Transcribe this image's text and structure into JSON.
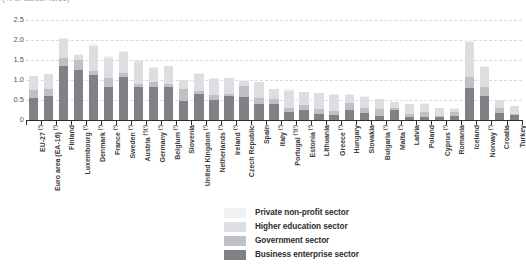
{
  "subtitle": "(% of labour force)",
  "colors": {
    "business_enterprise": "#808086",
    "government": "#bfbfc4",
    "higher_education": "#dedee2",
    "private_non_profit": "#f1f1f3",
    "gridline": "#d9d9de",
    "axis": "#2e2e2e"
  },
  "legend": {
    "items": [
      {
        "label": "Private non-profit sector",
        "color": "#f1f1f3"
      },
      {
        "label": "Higher education sector",
        "color": "#dedee2"
      },
      {
        "label": "Government sector",
        "color": "#bfbfc4"
      },
      {
        "label": "Business enterprise sector",
        "color": "#808086"
      }
    ]
  },
  "chart_data": {
    "type": "bar",
    "subtype": "stacked-vertical",
    "title": "",
    "subtitle": "(% of labour force)",
    "xlabel": "",
    "ylabel": "",
    "ylim": [
      0,
      2.5
    ],
    "yticks": [
      0,
      0.5,
      1.0,
      1.5,
      2.0,
      2.5
    ],
    "ytick_labels": [
      "0",
      "0.5",
      "1.0",
      "1.5",
      "2.0",
      "2.5"
    ],
    "grid": true,
    "legend_position": "bottom-center",
    "categories": [
      "EU-27 (¹)",
      "Euro area (EA-16) (¹)",
      "Finland",
      "Luxembourg (¹)",
      "Denmark (¹)",
      "France (¹)",
      "Sweden (¹)",
      "Austria (²)(¹)",
      "Germany (¹)",
      "Belgium (¹)",
      "Slovenia",
      "United Kingdom (¹)",
      "Netherlands (¹)",
      "Ireland (¹)",
      "Czech Republic",
      "Spain",
      "Italy (¹)",
      "Portugal (¹)(¹)",
      "Estonia (¹)",
      "Lithuania",
      "Greece (¹)",
      "Hungary",
      "Slovakia",
      "Bulgaria (¹)",
      "Malta (²)",
      "Latvia",
      "Poland",
      "Cyprus (¹)",
      "Romania",
      "Iceland",
      "Norway (¹)",
      "Croatia",
      "Turkey"
    ],
    "series": [
      {
        "name": "Business enterprise sector",
        "color": "#808086",
        "values": [
          0.56,
          0.6,
          1.35,
          1.24,
          1.13,
          0.83,
          1.07,
          0.82,
          0.82,
          0.83,
          0.47,
          0.65,
          0.49,
          0.6,
          0.57,
          0.39,
          0.39,
          0.19,
          0.26,
          0.15,
          0.12,
          0.24,
          0.17,
          0.1,
          0.26,
          0.08,
          0.08,
          0.07,
          0.1,
          0.8,
          0.61,
          0.17,
          0.12
        ]
      },
      {
        "name": "Government sector",
        "color": "#bfbfc4",
        "values": [
          0.18,
          0.18,
          0.21,
          0.25,
          0.1,
          0.21,
          0.11,
          0.09,
          0.14,
          0.08,
          0.3,
          0.07,
          0.13,
          0.04,
          0.27,
          0.17,
          0.13,
          0.12,
          0.12,
          0.12,
          0.11,
          0.18,
          0.14,
          0.17,
          0.04,
          0.08,
          0.13,
          0.04,
          0.11,
          0.28,
          0.22,
          0.13,
          0.03
        ]
      },
      {
        "name": "Higher education sector",
        "color": "#dedee2",
        "values": [
          0.35,
          0.36,
          0.47,
          0.14,
          0.63,
          0.52,
          0.53,
          0.56,
          0.35,
          0.44,
          0.23,
          0.43,
          0.4,
          0.4,
          0.14,
          0.39,
          0.25,
          0.42,
          0.31,
          0.4,
          0.4,
          0.21,
          0.27,
          0.25,
          0.15,
          0.24,
          0.2,
          0.19,
          0.07,
          0.88,
          0.49,
          0.19,
          0.19
        ]
      },
      {
        "name": "Private non-profit sector",
        "color": "#f1f1f3",
        "values": [
          0.01,
          0.01,
          0.02,
          0.02,
          0.03,
          0.03,
          0.01,
          0.01,
          0.01,
          0.01,
          0.01,
          0.02,
          0.02,
          0.01,
          0.01,
          0.01,
          0.01,
          0.05,
          0.01,
          0.01,
          0.01,
          0.01,
          0.01,
          0.01,
          0.01,
          0.01,
          0.01,
          0.01,
          0.01,
          0.04,
          0.03,
          0.01,
          0.01
        ]
      }
    ],
    "totals": [
      1.1,
      1.15,
      2.05,
      1.65,
      1.89,
      1.59,
      1.72,
      1.48,
      1.32,
      1.36,
      1.01,
      1.17,
      1.04,
      1.05,
      0.99,
      0.96,
      0.78,
      0.78,
      0.7,
      0.68,
      0.64,
      0.64,
      0.59,
      0.53,
      0.46,
      0.41,
      0.42,
      0.31,
      0.29,
      2.0,
      1.35,
      0.5,
      0.35
    ]
  }
}
